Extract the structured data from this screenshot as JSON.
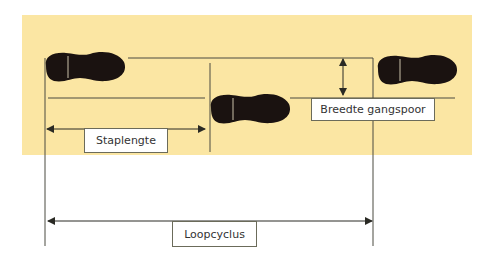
{
  "colors": {
    "background": "#ffffff",
    "floor": "#fbe6a3",
    "footprint": "#1a1210",
    "line": "#4a4a40"
  },
  "labels": {
    "step_length": "Staplengte",
    "track_width": "Breedte gangspoor",
    "gait_cycle": "Loopcyclus"
  },
  "footprints": [
    {
      "name": "footprint-left-1",
      "x": 46,
      "y": 51
    },
    {
      "name": "footprint-right",
      "x": 211,
      "y": 93
    },
    {
      "name": "footprint-left-2",
      "x": 377,
      "y": 53
    }
  ]
}
